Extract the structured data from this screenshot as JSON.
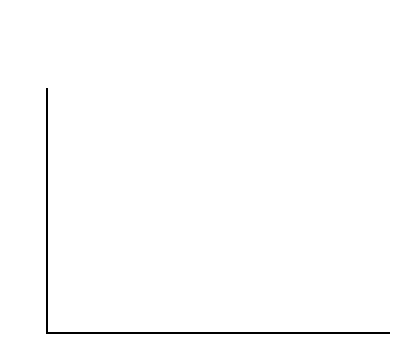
{
  "legend": {
    "items": [
      {
        "pattern": "plain",
        "line1": "blindfolded sighted",
        "line2": "average age 8yrs 3mths",
        "column": "left"
      },
      {
        "pattern": "cross",
        "line1": "late blind",
        "line2": "average age 10yrs 2mths",
        "column": "left"
      },
      {
        "pattern": "diag",
        "line1": "blind/light perception",
        "line2": "average age 11yrs 7mths",
        "column": "right"
      },
      {
        "pattern": "solid",
        "line1": "totally blind at birth",
        "line2": "average age 10yrs 2mths",
        "column": "right"
      }
    ]
  },
  "axes": {
    "ylabel": "score (per cent)",
    "yticks": [
      "0",
      "20",
      "40",
      "60",
      "80",
      "100"
    ],
    "ymin": 0,
    "ymax": 100
  },
  "chart_data": {
    "type": "bar",
    "title": "",
    "xlabel": "",
    "ylabel": "score (per cent)",
    "ylim": [
      0,
      100
    ],
    "ytick_interval": 20,
    "yminor_tick_interval": 10,
    "grid": false,
    "legend_position": "above-plot",
    "categories": [
      "LINES",
      "SEQUENCE",
      "DISTANCE",
      "CLOSED\nFIGURE",
      "SQUARE"
    ],
    "series": [
      {
        "name": "blindfolded sighted",
        "detail": "average age 8yrs 3mths",
        "pattern": "plain",
        "values": [
          94,
          88,
          79,
          92,
          86
        ]
      },
      {
        "name": "late blind",
        "detail": "average age 10yrs 2mths",
        "pattern": "cross",
        "values": [
          100,
          81,
          100,
          100,
          74
        ]
      },
      {
        "name": "blind/light perception",
        "detail": "average age 11yrs 7mths",
        "pattern": "diag",
        "values": [
          100,
          81,
          89,
          100,
          80
        ]
      },
      {
        "name": "totally blind at birth",
        "detail": "average age 10yrs 2mths",
        "pattern": "solid",
        "values": [
          100,
          93,
          87,
          100,
          90
        ]
      }
    ]
  }
}
